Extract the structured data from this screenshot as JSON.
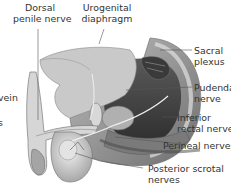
{
  "diagram": {
    "labels_top": [
      {
        "id": "dorsal-penile-nerve",
        "line1": "Dorsal",
        "line2": "penile nerve"
      },
      {
        "id": "urogenital-diaphragm",
        "line1": "Urogenital",
        "line2": "diaphragm"
      }
    ],
    "labels_right": [
      {
        "id": "sacral-plexus",
        "line1": "Sacral",
        "line2": "plexus"
      },
      {
        "id": "pudendal-nerve",
        "line1": "Pudendal",
        "line2": "nerve"
      },
      {
        "id": "inferior-rectal-nerves",
        "line1": "Inferior",
        "line2": "rectal nerves"
      },
      {
        "id": "perineal-nerves",
        "line1": "Perineal nerves",
        "line2": ""
      },
      {
        "id": "posterior-scrotal-nerves",
        "line1": "Posterior scrotal",
        "line2": "nerves"
      }
    ],
    "labels_left_cropped": [
      {
        "id": "vein-partial",
        "text": "vein"
      },
      {
        "id": "s-partial",
        "text": "s"
      }
    ],
    "colors": {
      "background": "#ffffff",
      "text": "#333333",
      "leader_line": "#555555",
      "illustration_dark": "#4a4a4a",
      "illustration_mid": "#8c8c8c",
      "illustration_light": "#d4d4d4"
    }
  }
}
